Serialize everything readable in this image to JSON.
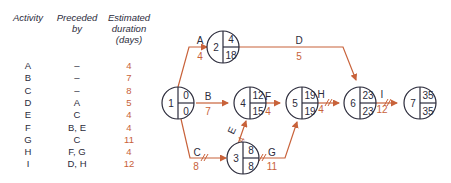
{
  "table": {
    "headers": {
      "activity": "Activity",
      "preceded_line1": "Preceded",
      "preceded_line2": "by",
      "duration_line1": "Estimated",
      "duration_line2": "duration",
      "duration_line3": "(days)"
    },
    "rows": [
      {
        "activity": "A",
        "preceded_by": "–",
        "duration": "4"
      },
      {
        "activity": "B",
        "preceded_by": "–",
        "duration": "7"
      },
      {
        "activity": "C",
        "preceded_by": "–",
        "duration": "8"
      },
      {
        "activity": "D",
        "preceded_by": "A",
        "duration": "5"
      },
      {
        "activity": "E",
        "preceded_by": "C",
        "duration": "4"
      },
      {
        "activity": "F",
        "preceded_by": "B, E",
        "duration": "4"
      },
      {
        "activity": "G",
        "preceded_by": "C",
        "duration": "11"
      },
      {
        "activity": "H",
        "preceded_by": "F, G",
        "duration": "4"
      },
      {
        "activity": "I",
        "preceded_by": "D, H",
        "duration": "12"
      }
    ]
  },
  "network": {
    "colors": {
      "arrow": "#c8623a",
      "node": "#2b2b3b",
      "duration": "#c8623a"
    },
    "nodes": [
      {
        "id": "1",
        "earliest": "0",
        "latest": "0"
      },
      {
        "id": "2",
        "earliest": "4",
        "latest": "18"
      },
      {
        "id": "3",
        "earliest": "8",
        "latest": "8"
      },
      {
        "id": "4",
        "earliest": "12",
        "latest": "15"
      },
      {
        "id": "5",
        "earliest": "19",
        "latest": "19"
      },
      {
        "id": "6",
        "earliest": "23",
        "latest": "23"
      },
      {
        "id": "7",
        "earliest": "35",
        "latest": "35"
      }
    ],
    "activities": [
      {
        "label": "A",
        "duration": "4",
        "from": "1",
        "to": "2",
        "critical": false
      },
      {
        "label": "B",
        "duration": "7",
        "from": "1",
        "to": "4",
        "critical": false
      },
      {
        "label": "C",
        "duration": "8",
        "from": "1",
        "to": "3",
        "critical": true
      },
      {
        "label": "D",
        "duration": "5",
        "from": "2",
        "to": "6",
        "critical": false
      },
      {
        "label": "E",
        "duration": "4",
        "from": "3",
        "to": "4",
        "critical": false
      },
      {
        "label": "F",
        "duration": "4",
        "from": "4",
        "to": "5",
        "critical": false
      },
      {
        "label": "G",
        "duration": "11",
        "from": "3",
        "to": "5",
        "critical": true
      },
      {
        "label": "H",
        "duration": "4",
        "from": "5",
        "to": "6",
        "critical": true
      },
      {
        "label": "I",
        "duration": "12",
        "from": "6",
        "to": "7",
        "critical": true
      }
    ]
  }
}
